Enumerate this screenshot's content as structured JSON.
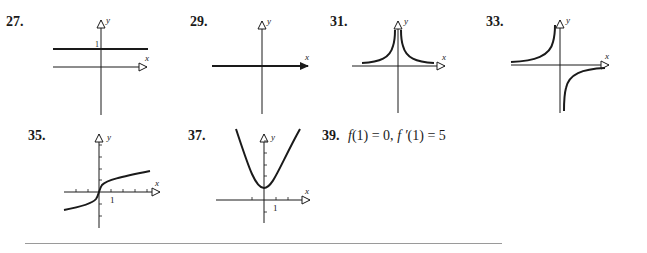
{
  "problems": [
    {
      "number": "27.",
      "type": "graph",
      "description": "horizontal line y = 1",
      "labels": {
        "x": "x",
        "y": "y",
        "tick": "1"
      }
    },
    {
      "number": "29.",
      "type": "graph",
      "description": "line along x-axis (y = 0)",
      "labels": {
        "x": "x",
        "y": "y"
      }
    },
    {
      "number": "31.",
      "type": "graph",
      "description": "even function with vertical asymptote at x = 0, approaching 0 as |x| grows (like 1/x^2)",
      "labels": {
        "x": "x",
        "y": "y"
      }
    },
    {
      "number": "33.",
      "type": "graph",
      "description": "odd function with vertical asymptote at x = 0 (like -1/x)",
      "labels": {
        "x": "x",
        "y": "y"
      }
    },
    {
      "number": "35.",
      "type": "graph",
      "description": "increasing cube-root-like curve through origin",
      "labels": {
        "x": "x",
        "y": "y",
        "tick": "1"
      }
    },
    {
      "number": "37.",
      "type": "graph",
      "description": "upward parabola with vertex at (0,1)",
      "labels": {
        "x": "x",
        "y": "y",
        "tick": "1"
      }
    },
    {
      "number": "39.",
      "type": "text",
      "f_expr": "f",
      "arg": "(1)",
      "eq1": "= 0,",
      "fprime_expr": "f ′",
      "eq2": "= 5"
    }
  ],
  "colors": {
    "ink": "#1a1a1a",
    "rule": "#9a9a9a"
  }
}
